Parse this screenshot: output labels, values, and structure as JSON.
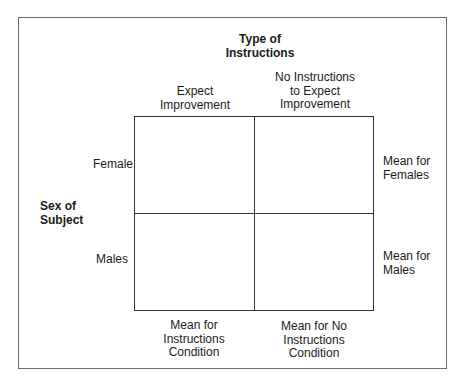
{
  "diagram": {
    "column_factor": "Type of\nInstructions",
    "columns": [
      {
        "label": "Expect\nImprovement"
      },
      {
        "label": "No Instructions\nto Expect\nImprovement"
      }
    ],
    "row_factor": "Sex of\nSubject",
    "rows": [
      {
        "label": "Female"
      },
      {
        "label": "Males"
      }
    ],
    "row_means": [
      "Mean for\nFemales",
      "Mean for\nMales"
    ],
    "column_means": [
      "Mean for\nInstructions\nCondition",
      "Mean for No\nInstructions\nCondition"
    ]
  }
}
